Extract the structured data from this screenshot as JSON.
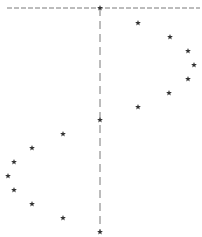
{
  "chart_data": {
    "type": "scatter",
    "title": "",
    "xlabel": "",
    "ylabel": "",
    "marker": "star",
    "marker_color": "#333333",
    "line_color": "#555555",
    "grid": false,
    "legend": null,
    "reference_lines": [
      {
        "orientation": "horizontal",
        "style": "dashed",
        "y_px": 8,
        "x_from_px": 7,
        "x_to_px": 200
      },
      {
        "orientation": "vertical",
        "style": "dashed",
        "x_px": 100,
        "y_from_px": 8,
        "y_to_px": 232
      }
    ],
    "series": [
      {
        "name": "center",
        "points_px": [
          [
            100,
            8
          ],
          [
            100,
            120
          ],
          [
            100,
            232
          ]
        ]
      },
      {
        "name": "right-arc",
        "points_px": [
          [
            138,
            23
          ],
          [
            170,
            37
          ],
          [
            188,
            51
          ],
          [
            194,
            65
          ],
          [
            188,
            79
          ],
          [
            169,
            93
          ],
          [
            138,
            107
          ]
        ]
      },
      {
        "name": "left-arc",
        "points_px": [
          [
            63,
            134
          ],
          [
            32,
            148
          ],
          [
            14,
            162
          ],
          [
            8,
            176
          ],
          [
            14,
            190
          ],
          [
            32,
            204
          ],
          [
            63,
            218
          ]
        ]
      }
    ]
  }
}
